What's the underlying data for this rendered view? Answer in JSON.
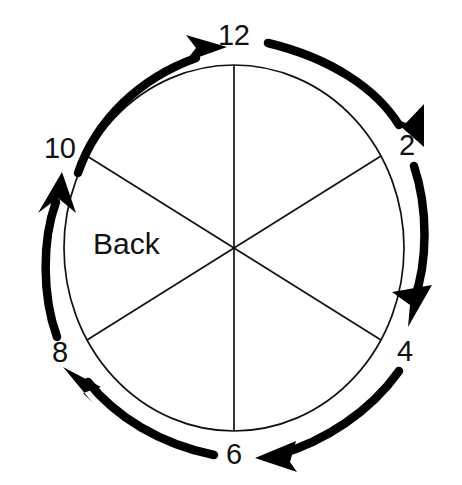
{
  "diagram": {
    "region_label": "Back",
    "rotation_direction": "clockwise",
    "colors": {
      "stroke": "#111111",
      "arrow": "#000000",
      "background": "#ffffff"
    },
    "circle": {
      "center_x": 234,
      "center_y": 248,
      "radius_x": 170,
      "radius_y": 183,
      "stroke_width": 1.6
    },
    "arc_ring": {
      "radius_x": 189,
      "radius_y": 203,
      "stroke_width": 8
    },
    "clock_labels": [
      {
        "id": "label-12",
        "text": "12",
        "hour": 12,
        "angle_deg": 0
      },
      {
        "id": "label-2",
        "text": "2",
        "hour": 2,
        "angle_deg": 60
      },
      {
        "id": "label-4",
        "text": "4",
        "hour": 4,
        "angle_deg": 120
      },
      {
        "id": "label-6",
        "text": "6",
        "hour": 6,
        "angle_deg": 180
      },
      {
        "id": "label-8",
        "text": "8",
        "hour": 8,
        "angle_deg": 240
      },
      {
        "id": "label-10",
        "text": "10",
        "hour": 10,
        "angle_deg": 300
      }
    ],
    "divider_lines": [
      {
        "name": "divider-12-6",
        "from_hour": 12,
        "to_hour": 6
      },
      {
        "name": "divider-2-8",
        "from_hour": 2,
        "to_hour": 8
      },
      {
        "name": "divider-10-4",
        "from_hour": 10,
        "to_hour": 4
      }
    ],
    "arrows": [
      {
        "name": "arrow-10-to-12",
        "from_hour": 10,
        "to_hour": 12,
        "points_to": "12"
      },
      {
        "name": "arrow-12-to-2",
        "from_hour": 12,
        "to_hour": 2,
        "points_to": "2"
      },
      {
        "name": "arrow-2-to-4",
        "from_hour": 2,
        "to_hour": 4,
        "points_to": "4"
      },
      {
        "name": "arrow-4-to-6",
        "from_hour": 4,
        "to_hour": 6,
        "points_to": "6"
      },
      {
        "name": "arrow-6-to-8",
        "from_hour": 6,
        "to_hour": 8,
        "points_to": "8"
      },
      {
        "name": "arrow-8-to-10",
        "from_hour": 8,
        "to_hour": 10,
        "points_to": "10"
      }
    ]
  }
}
